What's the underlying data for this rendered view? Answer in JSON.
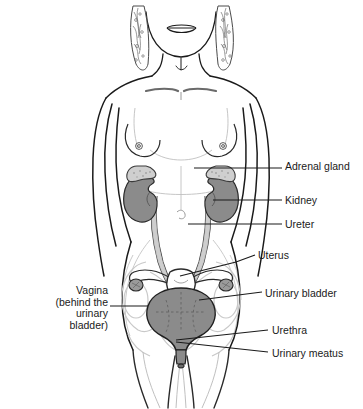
{
  "figure": {
    "background_color": "#ffffff",
    "line_color": "#1a1a1a",
    "organ_fill_gray": "#8b8b8b",
    "organ_light_gray": "#c9c9c9",
    "faint_outline": "#bdbdbd"
  },
  "labels": [
    {
      "id": "adrenal-gland",
      "text": "Adrenal gland",
      "x": 285,
      "y": 161,
      "align": "left"
    },
    {
      "id": "kidney",
      "text": "Kidney",
      "x": 285,
      "y": 195,
      "align": "left"
    },
    {
      "id": "ureter",
      "text": "Ureter",
      "x": 285,
      "y": 219,
      "align": "left"
    },
    {
      "id": "uterus",
      "text": "Uterus",
      "x": 258,
      "y": 250,
      "align": "left"
    },
    {
      "id": "urinary-bladder",
      "text": "Urinary bladder",
      "x": 265,
      "y": 288,
      "align": "left"
    },
    {
      "id": "urethra",
      "text": "Urethra",
      "x": 272,
      "y": 325,
      "align": "left"
    },
    {
      "id": "urinary-meatus",
      "text": "Urinary meatus",
      "x": 272,
      "y": 348,
      "align": "left"
    },
    {
      "id": "vagina",
      "text": "Vagina\n(behind the\nurinary\nbladder)",
      "x": 10,
      "y": 285,
      "align": "right"
    }
  ],
  "organs": [
    {
      "id": "adrenal-gland-left",
      "name": "Adrenal gland (left)",
      "fill": "#c9c9c9"
    },
    {
      "id": "adrenal-gland-right",
      "name": "Adrenal gland (right)",
      "fill": "#c9c9c9"
    },
    {
      "id": "kidney-left",
      "name": "Kidney (left)",
      "fill": "#8b8b8b"
    },
    {
      "id": "kidney-right",
      "name": "Kidney (right)",
      "fill": "#8b8b8b"
    },
    {
      "id": "ureter-left",
      "name": "Ureter (left)",
      "fill": "#b5b5b5"
    },
    {
      "id": "ureter-right",
      "name": "Ureter (right)",
      "fill": "#b5b5b5"
    },
    {
      "id": "urinary-bladder",
      "name": "Urinary bladder",
      "fill": "#8b8b8b"
    },
    {
      "id": "urethra",
      "name": "Urethra",
      "fill": "#8b8b8b"
    },
    {
      "id": "uterus",
      "name": "Uterus",
      "fill": "#ffffff"
    },
    {
      "id": "ovary-left",
      "name": "Ovary (left)",
      "fill": "#9a9a9a"
    },
    {
      "id": "ovary-right",
      "name": "Ovary (right)",
      "fill": "#9a9a9a"
    }
  ]
}
